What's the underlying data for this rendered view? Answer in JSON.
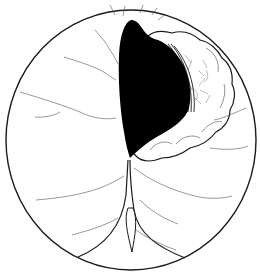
{
  "figure": {
    "description": "Endoscopic line illustration: circular field of view showing a dark lumen with folded mucosal rim and vascular markings",
    "colors": {
      "background": "#ffffff",
      "outline": "#1a1a1a",
      "lumen": "#000000",
      "vessels": "#555555",
      "stipple": "#777777"
    }
  }
}
